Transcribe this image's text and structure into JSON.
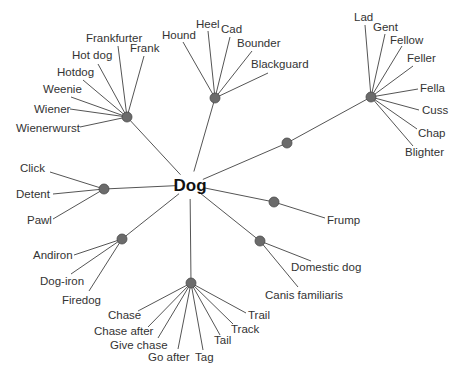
{
  "diagram": {
    "type": "word-sense tree",
    "center": {
      "label": "Dog",
      "x": 190,
      "y": 185
    },
    "colors": {
      "edge": "#555555",
      "hub": "#6b6b6b",
      "text": "#333333",
      "center_text": "#111111",
      "background": "#ffffff"
    },
    "branches": [
      {
        "name": "sausage",
        "hub": {
          "x": 127,
          "y": 117
        },
        "leaves": [
          {
            "label": "Frankfurter",
            "x": 86,
            "y": 42,
            "anchor": "start",
            "lx": 118,
            "ly": 46
          },
          {
            "label": "Frank",
            "x": 130,
            "y": 52,
            "anchor": "start",
            "lx": 144,
            "ly": 56
          },
          {
            "label": "Hot dog",
            "x": 72,
            "y": 59,
            "anchor": "start",
            "lx": 98,
            "ly": 64
          },
          {
            "label": "Hotdog",
            "x": 57,
            "y": 76,
            "anchor": "start",
            "lx": 83,
            "ly": 80
          },
          {
            "label": "Weenie",
            "x": 43,
            "y": 93,
            "anchor": "start",
            "lx": 71,
            "ly": 97
          },
          {
            "label": "Wiener",
            "x": 34,
            "y": 113,
            "anchor": "start",
            "lx": 70,
            "ly": 109
          },
          {
            "label": "Wienerwurst",
            "x": 16,
            "y": 132,
            "anchor": "start",
            "lx": 80,
            "ly": 127
          }
        ]
      },
      {
        "name": "scoundrel",
        "hub": {
          "x": 215,
          "y": 98
        },
        "leaves": [
          {
            "label": "Hound",
            "x": 162,
            "y": 39,
            "anchor": "start",
            "lx": 183,
            "ly": 42
          },
          {
            "label": "Heel",
            "x": 196,
            "y": 28,
            "anchor": "start",
            "lx": 208,
            "ly": 31
          },
          {
            "label": "Cad",
            "x": 221,
            "y": 33,
            "anchor": "start",
            "lx": 230,
            "ly": 37
          },
          {
            "label": "Bounder",
            "x": 237,
            "y": 47,
            "anchor": "start",
            "lx": 252,
            "ly": 51
          },
          {
            "label": "Blackguard",
            "x": 251,
            "y": 68,
            "anchor": "start",
            "lx": 268,
            "ly": 73
          }
        ]
      },
      {
        "name": "fellow",
        "hub": {
          "x": 371,
          "y": 97
        },
        "mid": {
          "x": 287,
          "y": 143
        },
        "leaves": [
          {
            "label": "Lad",
            "x": 354,
            "y": 21,
            "anchor": "start",
            "lx": 365,
            "ly": 25
          },
          {
            "label": "Gent",
            "x": 373,
            "y": 31,
            "anchor": "start",
            "lx": 385,
            "ly": 34
          },
          {
            "label": "Fellow",
            "x": 390,
            "y": 44,
            "anchor": "start",
            "lx": 402,
            "ly": 46
          },
          {
            "label": "Feller",
            "x": 407,
            "y": 62,
            "anchor": "start",
            "lx": 413,
            "ly": 66
          },
          {
            "label": "Fella",
            "x": 420,
            "y": 92,
            "anchor": "start",
            "lx": 418,
            "ly": 89
          },
          {
            "label": "Cuss",
            "x": 422,
            "y": 114,
            "anchor": "start",
            "lx": 419,
            "ly": 110
          },
          {
            "label": "Chap",
            "x": 418,
            "y": 137,
            "anchor": "start",
            "lx": 417,
            "ly": 129
          },
          {
            "label": "Blighter",
            "x": 405,
            "y": 156,
            "anchor": "start",
            "lx": 413,
            "ly": 146
          }
        ]
      },
      {
        "name": "catch",
        "hub": {
          "x": 104,
          "y": 189
        },
        "leaves": [
          {
            "label": "Click",
            "x": 20,
            "y": 172,
            "anchor": "start",
            "lx": 50,
            "ly": 172
          },
          {
            "label": "Detent",
            "x": 16,
            "y": 198,
            "anchor": "start",
            "lx": 53,
            "ly": 194
          },
          {
            "label": "Pawl",
            "x": 27,
            "y": 224,
            "anchor": "start",
            "lx": 53,
            "ly": 219
          }
        ]
      },
      {
        "name": "frump",
        "hub": {
          "x": 274,
          "y": 202
        },
        "leaves": [
          {
            "label": "Frump",
            "x": 327,
            "y": 224,
            "anchor": "start",
            "lx": 325,
            "ly": 218
          }
        ]
      },
      {
        "name": "domestic",
        "hub": {
          "x": 260,
          "y": 241
        },
        "leaves": [
          {
            "label": "Domestic dog",
            "x": 291,
            "y": 271,
            "anchor": "start",
            "lx": 311,
            "ly": 261
          },
          {
            "label": "Canis familiaris",
            "x": 265,
            "y": 299,
            "anchor": "start",
            "lx": 298,
            "ly": 287
          }
        ]
      },
      {
        "name": "andiron",
        "hub": {
          "x": 122,
          "y": 239
        },
        "leaves": [
          {
            "label": "Andiron",
            "x": 33,
            "y": 259,
            "anchor": "start",
            "lx": 74,
            "ly": 255
          },
          {
            "label": "Dog-iron",
            "x": 40,
            "y": 285,
            "anchor": "start",
            "lx": 71,
            "ly": 274
          },
          {
            "label": "Firedog",
            "x": 62,
            "y": 304,
            "anchor": "start",
            "lx": 89,
            "ly": 291
          }
        ]
      },
      {
        "name": "chase",
        "hub": {
          "x": 191,
          "y": 283
        },
        "leaves": [
          {
            "label": "Chase",
            "x": 108,
            "y": 319,
            "anchor": "start",
            "lx": 138,
            "ly": 311
          },
          {
            "label": "Chase after",
            "x": 94,
            "y": 335,
            "anchor": "start",
            "lx": 148,
            "ly": 327
          },
          {
            "label": "Give chase",
            "x": 110,
            "y": 349,
            "anchor": "start",
            "lx": 158,
            "ly": 338
          },
          {
            "label": "Go after",
            "x": 148,
            "y": 361,
            "anchor": "start",
            "lx": 178,
            "ly": 349
          },
          {
            "label": "Tag",
            "x": 195,
            "y": 361,
            "anchor": "start",
            "lx": 203,
            "ly": 350
          },
          {
            "label": "Tail",
            "x": 214,
            "y": 344,
            "anchor": "start",
            "lx": 220,
            "ly": 335
          },
          {
            "label": "Track",
            "x": 231,
            "y": 333,
            "anchor": "start",
            "lx": 233,
            "ly": 324
          },
          {
            "label": "Trail",
            "x": 248,
            "y": 319,
            "anchor": "start",
            "lx": 246,
            "ly": 313
          }
        ]
      }
    ]
  }
}
